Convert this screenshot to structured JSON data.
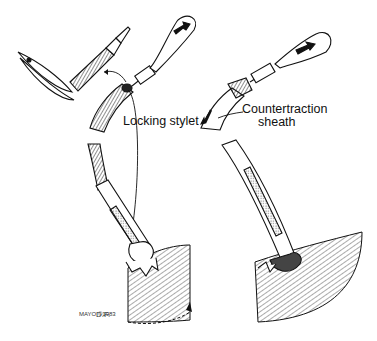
{
  "figure": {
    "labels": {
      "locking_stylet": "Locking stylet",
      "countertraction_line1": "Countertraction",
      "countertraction_line2": "sheath"
    },
    "signature": {
      "mark": "MAYO ©1983",
      "initials": "D.F."
    },
    "colors": {
      "ink": "#111111",
      "background": "#ffffff",
      "hatch": "#555555"
    }
  }
}
